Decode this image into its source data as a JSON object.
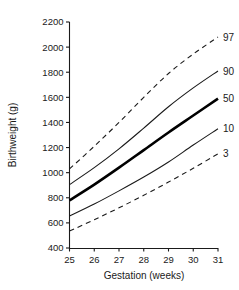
{
  "chart_data": {
    "type": "line",
    "title": "",
    "xlabel": "Gestation (weeks)",
    "ylabel": "Birthweight (g)",
    "xlim": [
      25,
      31
    ],
    "ylim": [
      400,
      2200
    ],
    "xticks": [
      "25",
      "26",
      "27",
      "28",
      "29",
      "30",
      "31"
    ],
    "yticks": [
      "400",
      "600",
      "800",
      "1000",
      "1200",
      "1400",
      "1600",
      "1800",
      "2000",
      "2200"
    ],
    "grid": false,
    "legend_position": "right-of-curve-ends",
    "x": [
      25,
      26,
      27,
      28,
      29,
      30,
      31
    ],
    "series": [
      {
        "name": "97",
        "label": "97",
        "style": "dashed",
        "values": [
          1030,
          1210,
          1400,
          1600,
          1790,
          1945,
          2080
        ]
      },
      {
        "name": "90",
        "label": "90",
        "style": "solid",
        "values": [
          905,
          1040,
          1190,
          1355,
          1525,
          1675,
          1810
        ]
      },
      {
        "name": "50",
        "label": "50",
        "style": "bold",
        "values": [
          780,
          905,
          1040,
          1180,
          1320,
          1455,
          1590
        ]
      },
      {
        "name": "10",
        "label": "10",
        "style": "solid",
        "values": [
          655,
          750,
          855,
          965,
          1085,
          1220,
          1350
        ]
      },
      {
        "name": "3",
        "label": "3",
        "style": "dashed",
        "values": [
          535,
          625,
          720,
          820,
          925,
          1035,
          1150
        ]
      }
    ]
  },
  "axes": {
    "y_title": "Birthweight (g)",
    "x_title": "Gestation (weeks)"
  }
}
